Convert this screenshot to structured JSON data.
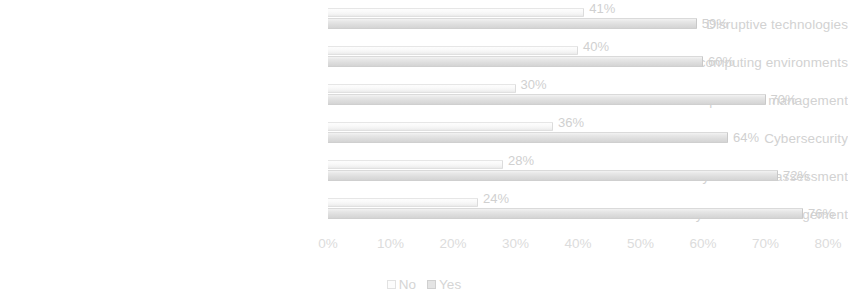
{
  "chart_data": {
    "type": "bar",
    "orientation": "horizontal",
    "grouped": true,
    "title": "",
    "subtitle": "",
    "xlabel": "",
    "ylabel": "",
    "xlim": [
      0,
      80
    ],
    "xtick_step": 10,
    "grid": false,
    "legend_position": "bottom-center",
    "categories": [
      "Disruptive technologies",
      "Cloud and virtual computing environments",
      "Extended enterprise risk management",
      "Cybersecurity",
      "Dynamic risk assessment",
      "Business continuity and crisis management"
    ],
    "series": [
      {
        "name": "No",
        "color": "#fafafa",
        "values": [
          41,
          40,
          30,
          36,
          28,
          24
        ],
        "value_labels": [
          "41%",
          "40%",
          "30%",
          "36%",
          "28%",
          "24%"
        ]
      },
      {
        "name": "Yes",
        "color": "#dedede",
        "values": [
          59,
          60,
          70,
          64,
          72,
          76
        ],
        "value_labels": [
          "59%",
          "60%",
          "70%",
          "64%",
          "72%",
          "76%"
        ]
      }
    ],
    "xticks": [
      {
        "value": 0,
        "label": "0%"
      },
      {
        "value": 10,
        "label": "10%"
      },
      {
        "value": 20,
        "label": "20%"
      },
      {
        "value": 30,
        "label": "30%"
      },
      {
        "value": 40,
        "label": "40%"
      },
      {
        "value": 50,
        "label": "50%"
      },
      {
        "value": 60,
        "label": "60%"
      },
      {
        "value": 70,
        "label": "70%"
      },
      {
        "value": 80,
        "label": "80%"
      }
    ],
    "legend": [
      {
        "label": "No",
        "swatch": "no"
      },
      {
        "label": "Yes",
        "swatch": "yes"
      }
    ]
  }
}
